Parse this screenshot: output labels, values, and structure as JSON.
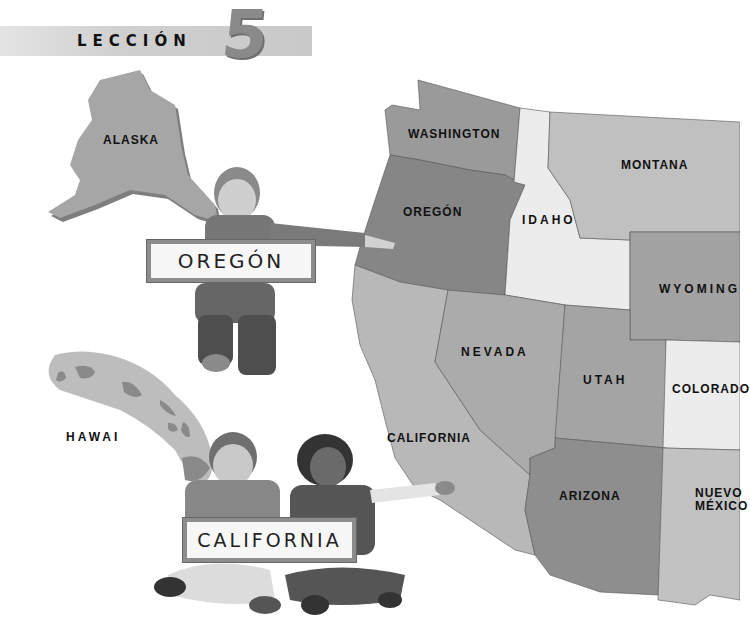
{
  "header": {
    "lesson_label": "LECCIÓN",
    "lesson_number": "5"
  },
  "map": {
    "states": [
      {
        "name": "ALASKA"
      },
      {
        "name": "HAWAI"
      },
      {
        "name": "WASHINGTON"
      },
      {
        "name": "OREGÓN"
      },
      {
        "name": "IDAHO"
      },
      {
        "name": "MONTANA"
      },
      {
        "name": "WYOMING"
      },
      {
        "name": "NEVADA"
      },
      {
        "name": "UTAH"
      },
      {
        "name": "COLORADO"
      },
      {
        "name": "CALIFORNIA"
      },
      {
        "name": "ARIZONA"
      },
      {
        "name": "NUEVO MÉXICO",
        "line1": "NUEVO",
        "line2": "MÉXICO"
      }
    ],
    "colors": {
      "dark": "#8f8f8f",
      "medium": "#a9a9a9",
      "light": "#c3c3c3",
      "pale": "#e9e9e9"
    }
  },
  "signs": {
    "oregon": "OREGÓN",
    "california": "CALIFORNIA"
  }
}
